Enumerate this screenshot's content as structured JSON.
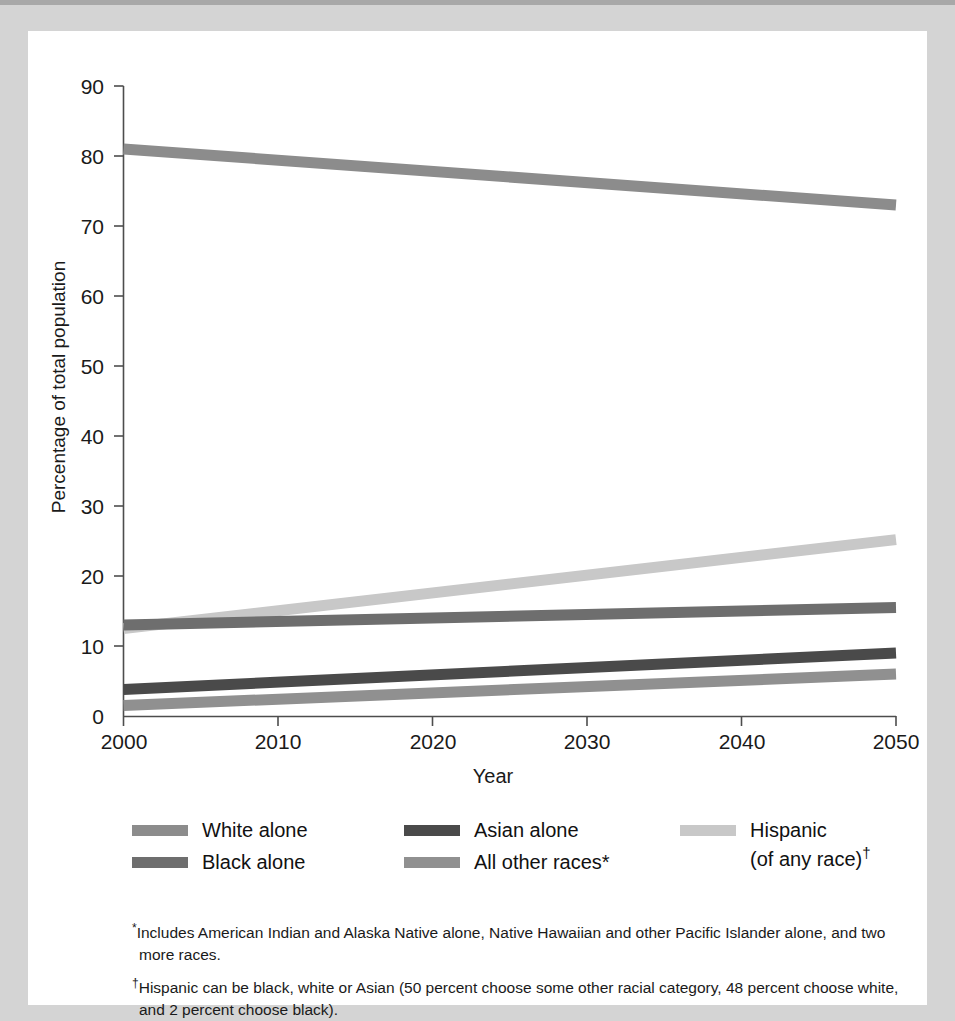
{
  "chart_data": {
    "type": "line",
    "title": "",
    "xlabel": "Year",
    "ylabel": "Percentage of total population",
    "x": [
      2000,
      2050
    ],
    "xlim": [
      2000,
      2050
    ],
    "ylim": [
      0,
      90
    ],
    "xticks": [
      "2000",
      "2010",
      "2020",
      "2030",
      "2040",
      "2050"
    ],
    "yticks": [
      "0",
      "10",
      "20",
      "30",
      "40",
      "50",
      "60",
      "70",
      "80",
      "90"
    ],
    "grid": false,
    "legend_position": "below-axes",
    "series": [
      {
        "name": "White alone",
        "values": [
          81,
          73
        ],
        "color": "#8c8c8c"
      },
      {
        "name": "Black alone",
        "values": [
          13,
          15.5
        ],
        "color": "#6e6e6e"
      },
      {
        "name": "Asian alone",
        "values": [
          3.8,
          9
        ],
        "color": "#4a4a4a"
      },
      {
        "name": "All other races*",
        "values": [
          1.5,
          6
        ],
        "color": "#909090"
      },
      {
        "name": "Hispanic\n(of any race)",
        "values": [
          12.5,
          25.2
        ],
        "color": "#c8c8c8"
      }
    ]
  },
  "axes": {
    "ylabel": "Percentage of total population",
    "xlabel": "Year",
    "yticks": [
      "90",
      "80",
      "70",
      "60",
      "50",
      "40",
      "30",
      "20",
      "10",
      "0"
    ],
    "xticks": [
      "2000",
      "2010",
      "2020",
      "2030",
      "2040",
      "2050"
    ]
  },
  "legend": {
    "entries": [
      {
        "label": "White alone",
        "color": "#8c8c8c"
      },
      {
        "label": "Black alone",
        "color": "#6e6e6e"
      },
      {
        "label": "Asian alone",
        "color": "#4a4a4a"
      },
      {
        "label": "All other races*",
        "color": "#909090"
      },
      {
        "label": "Hispanic\n(of any race)",
        "dagger": "†",
        "color": "#c8c8c8"
      }
    ]
  },
  "footnotes": [
    {
      "mark": "*",
      "text": "Includes American Indian and Alaska Native alone, Native Hawaiian and other Pacific Islander alone, and two more races."
    },
    {
      "mark": "†",
      "text": "Hispanic can be black, white or Asian (50 percent choose some other racial category, 48 percent choose white, and 2 percent choose black)."
    }
  ],
  "colors": {
    "page_background": "#d4d4d4",
    "card_background": "#ffffff",
    "axis": "#4d4d4d",
    "text": "#1a1a1a"
  }
}
